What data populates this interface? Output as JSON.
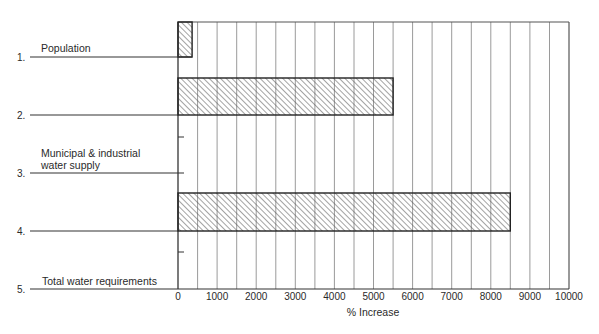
{
  "chart_data": {
    "type": "bar",
    "orientation": "horizontal",
    "title": "",
    "xlabel": "% Increase",
    "ylabel": "",
    "xlim": [
      0,
      10000
    ],
    "x_ticks": [
      "0",
      "1000",
      "2000",
      "3000",
      "4000",
      "5000",
      "6000",
      "7000",
      "8000",
      "9000",
      "10000"
    ],
    "grid": "vertical lines every 500",
    "legend": null,
    "categories": [
      {
        "number": "1.",
        "label": "Population"
      },
      {
        "number": "2.",
        "label": ""
      },
      {
        "number": "3.",
        "label": "Municipal & industrial water supply"
      },
      {
        "number": "4.",
        "label": ""
      },
      {
        "number": "5.",
        "label": "Total water requirements"
      }
    ],
    "bars": [
      {
        "row": 1,
        "value": 360
      },
      {
        "row": 2,
        "value": 5500
      },
      {
        "row": 4,
        "value": 8500
      }
    ],
    "fill": "diagonal hatch"
  },
  "labels": {
    "row1_num": "1.",
    "row1_text": "Population",
    "row2_num": "2.",
    "row3_num": "3.",
    "row3_text_a": "Municipal & industrial",
    "row3_text_b": "water supply",
    "row4_num": "4.",
    "row5_num": "5.",
    "row5_text": "Total water requirements",
    "xlabel": "% Increase",
    "ticks": [
      "0",
      "1000",
      "2000",
      "3000",
      "4000",
      "5000",
      "6000",
      "7000",
      "8000",
      "9000",
      "10000"
    ]
  }
}
